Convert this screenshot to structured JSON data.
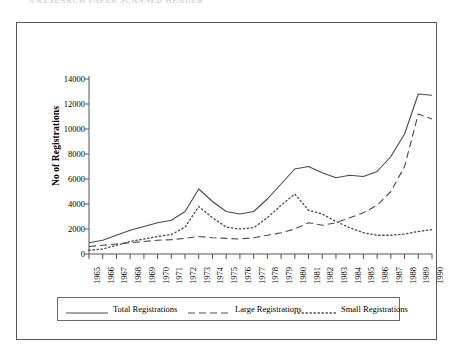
{
  "scan_header": "A   RESEARCH   PAPER   SCANNED   HEADER",
  "chart_data": {
    "type": "line",
    "title": "",
    "xlabel": "",
    "ylabel": "No of Registrations",
    "grid": false,
    "legend_position": "bottom",
    "xlim": [
      1965,
      1990
    ],
    "ylim": [
      0,
      14000
    ],
    "y_ticks": [
      0,
      2000,
      4000,
      6000,
      8000,
      10000,
      12000,
      14000
    ],
    "y_tick_labels": [
      "0",
      "2000",
      "4000",
      "6000",
      "8000",
      "10000",
      "12000",
      "14000"
    ],
    "categories": [
      "1965",
      "1966",
      "1967",
      "1968",
      "1969",
      "1970",
      "1971",
      "1972",
      "1973",
      "1974",
      "1975",
      "1976",
      "1977",
      "1978",
      "1979",
      "1980",
      "1981",
      "1982",
      "1983",
      "1984",
      "1985",
      "1986",
      "1987",
      "1988",
      "1989",
      "1990"
    ],
    "series": [
      {
        "name": "Total Registrations",
        "style": "solid",
        "color": "#4a4a4e",
        "values": [
          900,
          1100,
          1500,
          1900,
          2200,
          2500,
          2700,
          3400,
          5200,
          4200,
          3400,
          3200,
          3400,
          4400,
          5600,
          6800,
          7000,
          6500,
          6100,
          6300,
          6200,
          6600,
          7800,
          9600,
          12800,
          12700
        ]
      },
      {
        "name": "Large Registrations",
        "style": "dashed",
        "color": "#4a4a4e",
        "values": [
          600,
          700,
          800,
          900,
          1000,
          1100,
          1150,
          1250,
          1400,
          1300,
          1250,
          1200,
          1300,
          1500,
          1700,
          2000,
          2500,
          2300,
          2500,
          2900,
          3300,
          3900,
          5000,
          7000,
          11200,
          10800
        ]
      },
      {
        "name": "Small Registrations",
        "style": "dotted",
        "color": "#4a4a4e",
        "values": [
          300,
          400,
          700,
          1000,
          1200,
          1400,
          1550,
          2150,
          3800,
          2900,
          2150,
          2000,
          2100,
          2900,
          3900,
          4800,
          3500,
          3200,
          2600,
          2100,
          1700,
          1500,
          1500,
          1600,
          1800,
          1950
        ]
      }
    ]
  }
}
